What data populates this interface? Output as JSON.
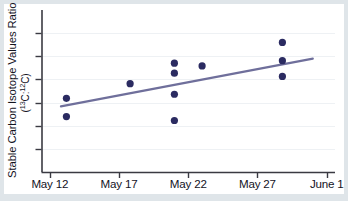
{
  "figure": {
    "background_color": "#dfe5e9",
    "card_color": "#ffffff"
  },
  "chart_data": {
    "type": "scatter",
    "title": "",
    "subtitle": "",
    "xlabel": "",
    "ylabel_line1": "Stable Carbon Isotope Values Ratio",
    "ylabel_line2_prefix": "(",
    "ylabel_line2_sup1": "13",
    "ylabel_line2_mid1": "C:",
    "ylabel_line2_sup2": "12",
    "ylabel_line2_suffix": "C)",
    "ylabel_plain": "Stable Carbon Isotope Values Ratio (13C:12C)",
    "x_tick_labels": [
      "May 12",
      "May 17",
      "May 22",
      "May 27",
      "June 1"
    ],
    "x_tick_values": [
      0,
      5,
      10,
      15,
      20
    ],
    "x": [
      1.2,
      1.2,
      5.8,
      9.0,
      9.0,
      9.0,
      9.0,
      11.0,
      16.8,
      16.8,
      16.8
    ],
    "y": [
      0.455,
      0.342,
      0.545,
      0.672,
      0.61,
      0.48,
      0.318,
      0.655,
      0.8,
      0.687,
      0.59
    ],
    "values": [
      {
        "x": 1.2,
        "y": 0.455,
        "date": "May 13"
      },
      {
        "x": 1.2,
        "y": 0.342,
        "date": "May 13"
      },
      {
        "x": 5.8,
        "y": 0.545,
        "date": "May 18"
      },
      {
        "x": 9.0,
        "y": 0.672,
        "date": "May 21"
      },
      {
        "x": 9.0,
        "y": 0.61,
        "date": "May 21"
      },
      {
        "x": 9.0,
        "y": 0.48,
        "date": "May 21"
      },
      {
        "x": 9.0,
        "y": 0.318,
        "date": "May 21"
      },
      {
        "x": 11.0,
        "y": 0.655,
        "date": "May 23"
      },
      {
        "x": 16.8,
        "y": 0.8,
        "date": "May 28"
      },
      {
        "x": 16.8,
        "y": 0.687,
        "date": "May 28"
      },
      {
        "x": 16.8,
        "y": 0.59,
        "date": "May 28"
      }
    ],
    "n_points": 11,
    "point_color": "#2b2b61",
    "point_radius_px": 3.6,
    "trendline": {
      "type": "line",
      "color": "#6f6f9b",
      "x_start": 0.8,
      "y_start": 0.405,
      "x_end": 19.0,
      "y_end": 0.7,
      "width_px": 2.1
    },
    "xlim": [
      -0.6,
      20.6
    ],
    "ylim": [
      0.0,
      1.0
    ],
    "y_ticks_labeled": false,
    "y_tick_count": 6,
    "grid": true,
    "grid_color": "#eef1f4",
    "axis_color": "#3a3a42",
    "legend": null,
    "legend_position": "none",
    "annotations": []
  }
}
